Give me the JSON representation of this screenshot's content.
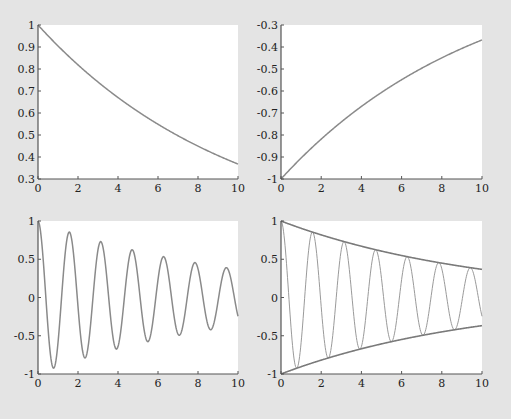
{
  "colors": {
    "background": "#e4e4e4",
    "plot_area": "#ffffff",
    "axis": "#555555",
    "curve": "#8a8a8a",
    "envelope": "#7a7a7a"
  },
  "chart_data": [
    {
      "type": "line",
      "title": "",
      "xlabel": "",
      "ylabel": "",
      "function": "exp(-0.1*x)",
      "series": [
        {
          "name": "exp(-0.1x)",
          "x": [
            0,
            1,
            2,
            3,
            4,
            5,
            6,
            7,
            8,
            9,
            10
          ],
          "values": [
            1.0,
            0.905,
            0.819,
            0.741,
            0.67,
            0.607,
            0.549,
            0.497,
            0.449,
            0.407,
            0.368
          ]
        }
      ],
      "xlim": [
        0,
        10
      ],
      "ylim": [
        0.3,
        1.0
      ],
      "xticks": [
        "0",
        "2",
        "4",
        "6",
        "8",
        "10"
      ],
      "yticks": [
        "0.3",
        "0.4",
        "0.5",
        "0.6",
        "0.7",
        "0.8",
        "0.9",
        "1"
      ],
      "grid": false
    },
    {
      "type": "line",
      "title": "",
      "xlabel": "",
      "ylabel": "",
      "function": "-exp(-0.1*x)",
      "series": [
        {
          "name": "-exp(-0.1x)",
          "x": [
            0,
            1,
            2,
            3,
            4,
            5,
            6,
            7,
            8,
            9,
            10
          ],
          "values": [
            -1.0,
            -0.905,
            -0.819,
            -0.741,
            -0.67,
            -0.607,
            -0.549,
            -0.497,
            -0.449,
            -0.407,
            -0.368
          ]
        }
      ],
      "xlim": [
        0,
        10
      ],
      "ylim": [
        -1.0,
        -0.3
      ],
      "xticks": [
        "0",
        "2",
        "4",
        "6",
        "8",
        "10"
      ],
      "yticks": [
        "-1",
        "-0.9",
        "-0.8",
        "-0.7",
        "-0.6",
        "-0.5",
        "-0.4",
        "-0.3"
      ],
      "grid": false
    },
    {
      "type": "line",
      "title": "",
      "xlabel": "",
      "ylabel": "",
      "function": "exp(-0.1*x)*cos(4*x)",
      "series": [
        {
          "name": "exp(-0.1x)cos(4x)",
          "peaks_x": [
            0,
            1.57,
            3.14,
            4.71,
            6.28,
            7.85,
            9.42
          ],
          "peaks_y": [
            1.0,
            0.85,
            0.73,
            0.62,
            0.53,
            0.46,
            0.39
          ],
          "troughs_x": [
            0.79,
            2.36,
            3.93,
            5.5,
            7.07,
            8.64
          ],
          "troughs_y": [
            -0.92,
            -0.79,
            -0.68,
            -0.58,
            -0.49,
            -0.42
          ]
        }
      ],
      "xlim": [
        0,
        10
      ],
      "ylim": [
        -1,
        1
      ],
      "xticks": [
        "0",
        "2",
        "4",
        "6",
        "8",
        "10"
      ],
      "yticks": [
        "-1",
        "-0.5",
        "0",
        "0.5",
        "1"
      ],
      "grid": false
    },
    {
      "type": "line",
      "title": "",
      "xlabel": "",
      "ylabel": "",
      "series": [
        {
          "name": "exp(-0.1x)cos(4x)",
          "function": "exp(-0.1*x)*cos(4*x)"
        },
        {
          "name": "upper envelope",
          "function": "exp(-0.1*x)",
          "values_at_0_10": [
            1.0,
            0.368
          ]
        },
        {
          "name": "lower envelope",
          "function": "-exp(-0.1*x)",
          "values_at_0_10": [
            -1.0,
            -0.368
          ]
        }
      ],
      "xlim": [
        0,
        10
      ],
      "ylim": [
        -1,
        1
      ],
      "xticks": [
        "0",
        "2",
        "4",
        "6",
        "8",
        "10"
      ],
      "yticks": [
        "-1",
        "-0.5",
        "0",
        "0.5",
        "1"
      ],
      "grid": false
    }
  ],
  "panels": [
    {
      "x0": 38,
      "x1": 238,
      "y0": 25,
      "y1": 179
    },
    {
      "x0": 281,
      "x1": 482,
      "y0": 25,
      "y1": 179
    },
    {
      "x0": 38,
      "x1": 238,
      "y0": 221,
      "y1": 374
    },
    {
      "x0": 281,
      "x1": 482,
      "y0": 221,
      "y1": 374
    }
  ]
}
